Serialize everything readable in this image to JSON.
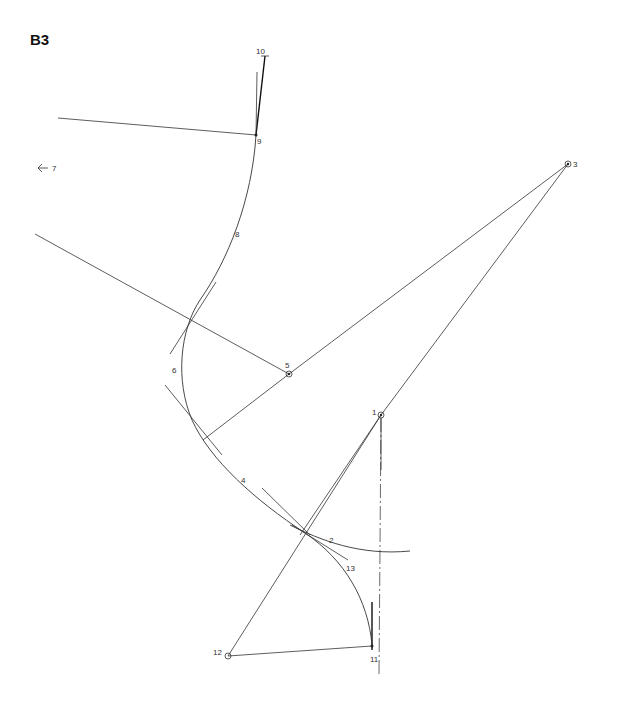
{
  "figure": {
    "title": "B3"
  },
  "labels": {
    "p1": "1",
    "p2": "2",
    "p3": "3",
    "p4": "4",
    "p5": "5",
    "p6": "6",
    "p7": "7",
    "p8": "8",
    "p9": "9",
    "p10": "10",
    "p11": "11",
    "p12": "12",
    "p13": "13"
  },
  "colors": {
    "line": "#333333",
    "background": "#ffffff"
  }
}
